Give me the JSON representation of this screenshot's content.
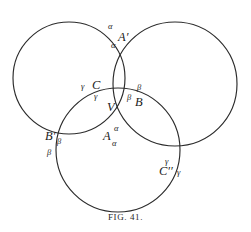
{
  "figure": {
    "caption": "FIG. 41.",
    "stroke_color": "#2b2b2b",
    "background_color": "#ffffff",
    "text_color": "#222222"
  },
  "diagram": {
    "type": "geometry-three-circles",
    "circles": [
      {
        "name": "left-circle",
        "cx": 69,
        "cy": 78,
        "r": 56
      },
      {
        "name": "right-circle",
        "cx": 175,
        "cy": 84,
        "r": 62
      },
      {
        "name": "bottom-circle",
        "cx": 118,
        "cy": 150,
        "r": 62
      }
    ],
    "points": [
      {
        "name": "point-A-prime",
        "label": "A′",
        "x": 118,
        "y": 38
      },
      {
        "name": "point-C",
        "label": "C",
        "x": 92,
        "y": 86
      },
      {
        "name": "point-B",
        "label": "B",
        "x": 135,
        "y": 103
      },
      {
        "name": "vertex-V",
        "label": "V",
        "x": 107,
        "y": 108
      },
      {
        "name": "point-A",
        "label": "A",
        "x": 103,
        "y": 137
      },
      {
        "name": "point-B-prime",
        "label": "B′",
        "x": 45,
        "y": 137
      },
      {
        "name": "point-C-prime",
        "label": "C′′",
        "x": 159,
        "y": 172
      }
    ],
    "angle_labels": [
      {
        "name": "angle-alpha-upper-outer",
        "label": "α",
        "x": 108,
        "y": 26
      },
      {
        "name": "angle-alpha-upper-inner",
        "label": "α",
        "x": 111,
        "y": 45
      },
      {
        "name": "angle-gamma-C-left",
        "label": "γ",
        "x": 81,
        "y": 86
      },
      {
        "name": "angle-gamma-C-inner",
        "label": "γ",
        "x": 94,
        "y": 96
      },
      {
        "name": "angle-beta-B-outer",
        "label": "β",
        "x": 137,
        "y": 87
      },
      {
        "name": "angle-beta-B-inner",
        "label": "β",
        "x": 127,
        "y": 97
      },
      {
        "name": "angle-alpha-A-upper",
        "label": "α",
        "x": 114,
        "y": 128
      },
      {
        "name": "angle-alpha-A-lower",
        "label": "α",
        "x": 112,
        "y": 143
      },
      {
        "name": "angle-beta-Bprime-right",
        "label": "β",
        "x": 57,
        "y": 141
      },
      {
        "name": "angle-beta-Bprime-below",
        "label": "β",
        "x": 47,
        "y": 152
      },
      {
        "name": "angle-gamma-Cprime-top",
        "label": "γ",
        "x": 165,
        "y": 161
      },
      {
        "name": "angle-gamma-Cprime-right",
        "label": "γ",
        "x": 177,
        "y": 172
      }
    ]
  }
}
